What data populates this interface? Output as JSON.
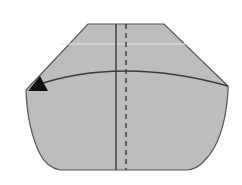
{
  "diagram": {
    "type": "origami-fold-diagram",
    "background": "#ffffff",
    "paper_fill": "#bdbdbd",
    "stroke_color": "#555555",
    "elements": [
      {
        "name": "paper-shape",
        "description": "octagonal paper with flat top and rounded bottom"
      },
      {
        "name": "valley-fold-line",
        "style": "solid",
        "orientation": "vertical"
      },
      {
        "name": "mountain-fold-line",
        "style": "dashed",
        "orientation": "vertical"
      },
      {
        "name": "curved-fold-line",
        "style": "solid",
        "orientation": "horizontal-arc"
      },
      {
        "name": "direction-arrow",
        "description": "black triangle arrow at left end"
      }
    ]
  }
}
